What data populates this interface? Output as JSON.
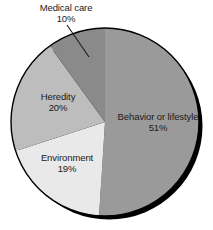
{
  "chart_data": {
    "type": "pie",
    "title": "",
    "subtitle": "",
    "xlabel": "",
    "ylabel": "",
    "legend_position": "none",
    "grid": false,
    "units": "percent",
    "start_angle_deg": 0,
    "direction": "clockwise",
    "categories": [
      "Behavior or lifestyle",
      "Environment",
      "Heredity",
      "Medical care"
    ],
    "values": [
      51,
      19,
      20,
      10
    ],
    "slices": [
      {
        "label": "Behavior or lifestyle",
        "value": 51,
        "value_text": "51%",
        "color": "#9a9a9a",
        "label_placement": "inside",
        "leader_line": false
      },
      {
        "label": "Environment",
        "value": 19,
        "value_text": "19%",
        "color": "#e9e9e9",
        "label_placement": "inside",
        "leader_line": false
      },
      {
        "label": "Heredity",
        "value": 20,
        "value_text": "20%",
        "color": "#bdbdbd",
        "label_placement": "inside",
        "leader_line": false
      },
      {
        "label": "Medical care",
        "value": 10,
        "value_text": "10%",
        "color": "#8a8a8a",
        "label_placement": "outside-top",
        "leader_line": true
      }
    ]
  },
  "figure": {
    "background": "#ffffff",
    "text_color": "#1a1a1a",
    "outline_color": "#000000",
    "shadow_color": "#000000",
    "center_x": 105,
    "center_y": 122,
    "radius": 94
  },
  "labels": {
    "medical_care": {
      "name": "Medical care",
      "pct": "10%"
    },
    "heredity": {
      "name": "Heredity",
      "pct": "20%"
    },
    "environment": {
      "name": "Environment",
      "pct": "19%"
    },
    "behavior": {
      "name": "Behavior or lifestyle",
      "pct": "51%"
    }
  }
}
